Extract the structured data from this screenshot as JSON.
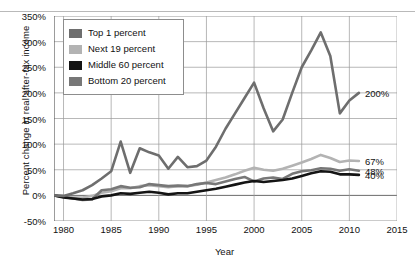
{
  "chart_data": {
    "type": "line",
    "title": "",
    "xlabel": "Year",
    "ylabel": "Percent change in real after-tax income",
    "xlim": [
      1979,
      2015
    ],
    "ylim": [
      -50,
      350
    ],
    "xticks": [
      "1980",
      "1985",
      "1990",
      "1995",
      "2000",
      "2005",
      "2010",
      "2015"
    ],
    "xtick_values": [
      1980,
      1985,
      1990,
      1995,
      2000,
      2005,
      2010,
      2015
    ],
    "yticks": [
      "-50%",
      "0%",
      "50%",
      "100%",
      "150%",
      "200%",
      "250%",
      "300%",
      "350%"
    ],
    "ytick_values": [
      -50,
      0,
      50,
      100,
      150,
      200,
      250,
      300,
      350
    ],
    "grid": true,
    "legend_position": "upper-left",
    "x": [
      1979,
      1980,
      1981,
      1982,
      1983,
      1984,
      1985,
      1986,
      1987,
      1988,
      1989,
      1990,
      1991,
      1992,
      1993,
      1994,
      1995,
      1996,
      1997,
      1998,
      1999,
      2000,
      2001,
      2002,
      2003,
      2004,
      2005,
      2006,
      2007,
      2008,
      2009,
      2010,
      2011
    ],
    "series": [
      {
        "name": "Top 1 percent",
        "color": "#6e6e6e",
        "end_label": "200%",
        "end_value": 200,
        "values": [
          0,
          -1,
          4,
          10,
          20,
          33,
          47,
          105,
          44,
          92,
          84,
          78,
          52,
          75,
          55,
          57,
          68,
          95,
          130,
          160,
          190,
          220,
          170,
          125,
          148,
          200,
          250,
          283,
          318,
          272,
          160,
          185,
          200
        ]
      },
      {
        "name": "Next 19 percent",
        "color": "#b3b3b3",
        "end_label": "67%",
        "end_value": 67,
        "values": [
          0,
          -2,
          -4,
          -4,
          -1,
          5,
          8,
          14,
          14,
          18,
          20,
          18,
          16,
          18,
          18,
          21,
          25,
          30,
          35,
          41,
          48,
          54,
          50,
          48,
          52,
          58,
          64,
          71,
          79,
          73,
          65,
          68,
          67
        ]
      },
      {
        "name": "Middle 60 percent",
        "color": "#141414",
        "end_label": "40%",
        "end_value": 40,
        "values": [
          0,
          -4,
          -6,
          -8,
          -7,
          -2,
          0,
          4,
          3,
          5,
          7,
          5,
          2,
          4,
          4,
          7,
          10,
          13,
          17,
          21,
          25,
          28,
          26,
          28,
          30,
          33,
          38,
          43,
          47,
          46,
          41,
          41,
          40
        ]
      },
      {
        "name": "Bottom 20 percent",
        "color": "#777777",
        "end_label": "48%",
        "end_value": 48,
        "values": [
          0,
          -3,
          -6,
          -9,
          -8,
          10,
          12,
          18,
          15,
          16,
          22,
          20,
          18,
          19,
          18,
          22,
          24,
          22,
          27,
          32,
          36,
          27,
          33,
          35,
          32,
          42,
          47,
          49,
          53,
          52,
          48,
          51,
          48
        ]
      }
    ]
  },
  "legend": {
    "items": [
      {
        "label": "Top 1 percent",
        "color": "#6e6e6e"
      },
      {
        "label": "Next 19 percent",
        "color": "#b3b3b3"
      },
      {
        "label": "Middle 60 percent",
        "color": "#141414"
      },
      {
        "label": "Bottom 20 percent",
        "color": "#777777"
      }
    ]
  },
  "axes": {
    "y_title": "Percent change in real after-tax income",
    "x_title": "Year"
  }
}
